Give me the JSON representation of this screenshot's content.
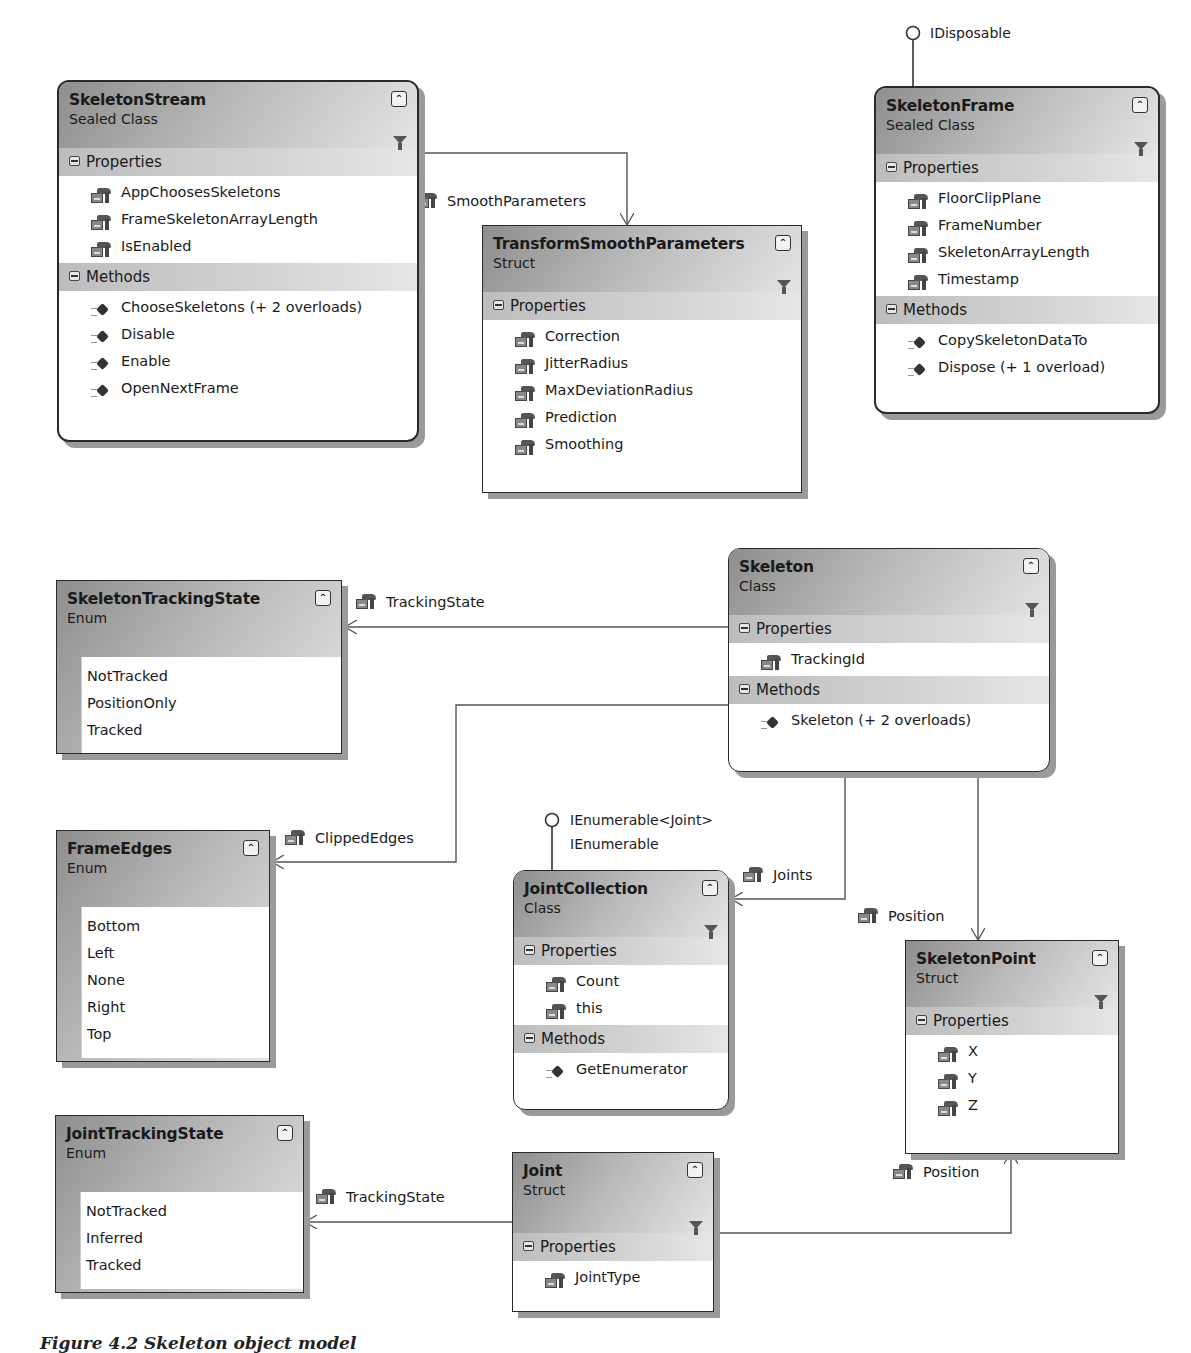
{
  "caption": "Figure 4.2 Skeleton object model",
  "colors": {
    "border": "#2a2a2a",
    "header_dark": "#8e8e8e",
    "header_light": "#e4e4e4",
    "section": "#c8c8c8",
    "shadow": "#9a9a9a"
  },
  "icons": {
    "collapse": "chevron-double-up-icon",
    "filter": "funnel-icon",
    "property": "property-hand-icon",
    "method": "method-diamond-icon",
    "section_toggle": "minus-square-icon"
  },
  "classes": {
    "skeletonStream": {
      "name": "SkeletonStream",
      "kind": "Sealed Class",
      "sections": [
        {
          "title": "Properties",
          "members": [
            "AppChoosesSkeletons",
            "FrameSkeletonArrayLength",
            "IsEnabled"
          ]
        },
        {
          "title": "Methods",
          "members": [
            "ChooseSkeletons (+ 2 overloads)",
            "Disable",
            "Enable",
            "OpenNextFrame"
          ]
        }
      ]
    },
    "transformSmoothParameters": {
      "name": "TransformSmoothParameters",
      "kind": "Struct",
      "sections": [
        {
          "title": "Properties",
          "members": [
            "Correction",
            "JitterRadius",
            "MaxDeviationRadius",
            "Prediction",
            "Smoothing"
          ]
        }
      ]
    },
    "skeletonFrame": {
      "name": "SkeletonFrame",
      "kind": "Sealed Class",
      "interface": "IDisposable",
      "sections": [
        {
          "title": "Properties",
          "members": [
            "FloorClipPlane",
            "FrameNumber",
            "SkeletonArrayLength",
            "Timestamp"
          ]
        },
        {
          "title": "Methods",
          "members": [
            "CopySkeletonDataTo",
            "Dispose (+ 1 overload)"
          ]
        }
      ]
    },
    "skeleton": {
      "name": "Skeleton",
      "kind": "Class",
      "sections": [
        {
          "title": "Properties",
          "members": [
            "TrackingId"
          ]
        },
        {
          "title": "Methods",
          "members": [
            "Skeleton (+ 2 overloads)"
          ]
        }
      ]
    },
    "jointCollection": {
      "name": "JointCollection",
      "kind": "Class",
      "interfaces": [
        "IEnumerable<Joint>",
        "IEnumerable"
      ],
      "sections": [
        {
          "title": "Properties",
          "members": [
            "Count",
            "this"
          ]
        },
        {
          "title": "Methods",
          "members": [
            "GetEnumerator"
          ]
        }
      ]
    },
    "skeletonPoint": {
      "name": "SkeletonPoint",
      "kind": "Struct",
      "sections": [
        {
          "title": "Properties",
          "members": [
            "X",
            "Y",
            "Z"
          ]
        }
      ]
    },
    "joint": {
      "name": "Joint",
      "kind": "Struct",
      "sections": [
        {
          "title": "Properties",
          "members": [
            "JointType"
          ]
        }
      ]
    }
  },
  "enums": {
    "skeletonTrackingState": {
      "name": "SkeletonTrackingState",
      "kind": "Enum",
      "values": [
        "NotTracked",
        "PositionOnly",
        "Tracked"
      ]
    },
    "frameEdges": {
      "name": "FrameEdges",
      "kind": "Enum",
      "values": [
        "Bottom",
        "Left",
        "None",
        "Right",
        "Top"
      ]
    },
    "jointTrackingState": {
      "name": "JointTrackingState",
      "kind": "Enum",
      "values": [
        "NotTracked",
        "Inferred",
        "Tracked"
      ]
    }
  },
  "associations": {
    "smoothParameters": "SmoothParameters",
    "trackingState": "TrackingState",
    "clippedEdges": "ClippedEdges",
    "joints": "Joints",
    "skeletonPosition": "Position",
    "jointPosition": "Position",
    "jointTrackingState": "TrackingState"
  }
}
